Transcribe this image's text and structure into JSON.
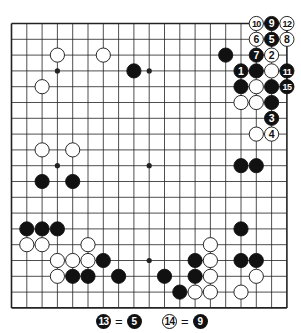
{
  "diagram": {
    "type": "go-board",
    "size": 19,
    "colors": {
      "background": "#ffffff",
      "line": "#222222",
      "black": "#111111",
      "white": "#ffffff"
    },
    "hoshi": [
      [
        3,
        3
      ],
      [
        9,
        3
      ],
      [
        15,
        3
      ],
      [
        3,
        9
      ],
      [
        9,
        9
      ],
      [
        15,
        9
      ],
      [
        3,
        15
      ],
      [
        9,
        15
      ],
      [
        15,
        15
      ]
    ],
    "stones": [
      {
        "color": "white",
        "col": 3,
        "row": 2
      },
      {
        "color": "white",
        "col": 6,
        "row": 2
      },
      {
        "color": "white",
        "col": 2,
        "row": 4
      },
      {
        "color": "black",
        "col": 8,
        "row": 3
      },
      {
        "color": "black",
        "col": 14,
        "row": 2
      },
      {
        "color": "white",
        "col": 16,
        "row": 0,
        "label": "10"
      },
      {
        "color": "black",
        "col": 17,
        "row": 0,
        "label": "9"
      },
      {
        "color": "white",
        "col": 18,
        "row": 0,
        "label": "12"
      },
      {
        "color": "white",
        "col": 16,
        "row": 1,
        "label": "6"
      },
      {
        "color": "black",
        "col": 17,
        "row": 1,
        "label": "5"
      },
      {
        "color": "white",
        "col": 18,
        "row": 1,
        "label": "8"
      },
      {
        "color": "black",
        "col": 16,
        "row": 2,
        "label": "7"
      },
      {
        "color": "white",
        "col": 17,
        "row": 2,
        "label": "2"
      },
      {
        "color": "black",
        "col": 15,
        "row": 3,
        "label": "1"
      },
      {
        "color": "black",
        "col": 16,
        "row": 3
      },
      {
        "color": "white",
        "col": 17,
        "row": 3
      },
      {
        "color": "black",
        "col": 18,
        "row": 3,
        "label": "11"
      },
      {
        "color": "black",
        "col": 15,
        "row": 4
      },
      {
        "color": "white",
        "col": 16,
        "row": 4
      },
      {
        "color": "black",
        "col": 17,
        "row": 4
      },
      {
        "color": "black",
        "col": 18,
        "row": 4,
        "label": "15"
      },
      {
        "color": "white",
        "col": 15,
        "row": 5
      },
      {
        "color": "white",
        "col": 16,
        "row": 5
      },
      {
        "color": "black",
        "col": 17,
        "row": 5
      },
      {
        "color": "black",
        "col": 17,
        "row": 6,
        "label": "3"
      },
      {
        "color": "white",
        "col": 16,
        "row": 7
      },
      {
        "color": "white",
        "col": 17,
        "row": 7,
        "label": "4"
      },
      {
        "color": "white",
        "col": 2,
        "row": 8
      },
      {
        "color": "white",
        "col": 4,
        "row": 8
      },
      {
        "color": "black",
        "col": 2,
        "row": 10
      },
      {
        "color": "black",
        "col": 4,
        "row": 10
      },
      {
        "color": "black",
        "col": 15,
        "row": 9
      },
      {
        "color": "black",
        "col": 16,
        "row": 9
      },
      {
        "color": "black",
        "col": 1,
        "row": 13
      },
      {
        "color": "black",
        "col": 2,
        "row": 13
      },
      {
        "color": "black",
        "col": 3,
        "row": 13
      },
      {
        "color": "white",
        "col": 1,
        "row": 14
      },
      {
        "color": "white",
        "col": 2,
        "row": 14
      },
      {
        "color": "white",
        "col": 5,
        "row": 14
      },
      {
        "color": "white",
        "col": 3,
        "row": 15
      },
      {
        "color": "white",
        "col": 4,
        "row": 15
      },
      {
        "color": "white",
        "col": 5,
        "row": 15
      },
      {
        "color": "black",
        "col": 6,
        "row": 15
      },
      {
        "color": "white",
        "col": 3,
        "row": 16
      },
      {
        "color": "black",
        "col": 4,
        "row": 16
      },
      {
        "color": "black",
        "col": 5,
        "row": 16
      },
      {
        "color": "black",
        "col": 7,
        "row": 16
      },
      {
        "color": "black",
        "col": 15,
        "row": 13
      },
      {
        "color": "white",
        "col": 13,
        "row": 14
      },
      {
        "color": "black",
        "col": 12,
        "row": 15
      },
      {
        "color": "white",
        "col": 13,
        "row": 15
      },
      {
        "color": "black",
        "col": 15,
        "row": 15
      },
      {
        "color": "black",
        "col": 16,
        "row": 15
      },
      {
        "color": "black",
        "col": 10,
        "row": 16
      },
      {
        "color": "black",
        "col": 12,
        "row": 16
      },
      {
        "color": "white",
        "col": 13,
        "row": 16
      },
      {
        "color": "white",
        "col": 16,
        "row": 16
      },
      {
        "color": "black",
        "col": 11,
        "row": 17
      },
      {
        "color": "white",
        "col": 12,
        "row": 17
      },
      {
        "color": "white",
        "col": 13,
        "row": 17
      },
      {
        "color": "white",
        "col": 15,
        "row": 17
      }
    ]
  },
  "caption": {
    "notes": [
      {
        "stone_color": "black",
        "move": "13",
        "equals": "=",
        "target_color": "black",
        "target": "5"
      },
      {
        "stone_color": "white",
        "move": "14",
        "equals": "=",
        "target_color": "black",
        "target": "9"
      }
    ]
  }
}
